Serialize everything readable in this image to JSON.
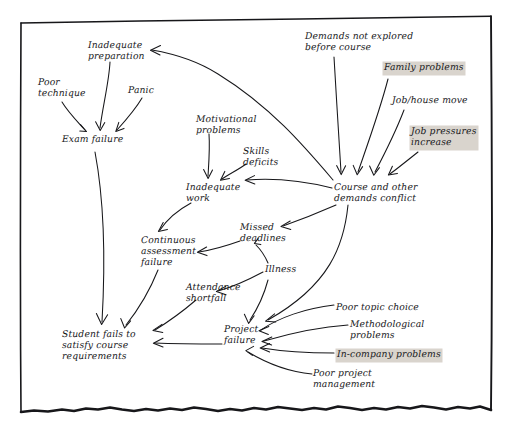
{
  "diagram": {
    "medium": "hand-drawn-sketch",
    "ink_color": "#17171a",
    "paper_color": "#ffffff",
    "highlight_color": "#d9d4cd",
    "frame": {
      "style": "hand-drawn rectangle, torn wavy bottom edge",
      "left_x": 20,
      "right_x": 492,
      "top_y_left": 22,
      "top_y_right": 16,
      "bottom_y": 414
    },
    "nodes": [
      {
        "id": "inadequate-preparation",
        "label": "Inadequate\npreparation",
        "x": 88,
        "y": 41,
        "highlight": false
      },
      {
        "id": "poor-technique",
        "label": "Poor\ntechnique",
        "x": 38,
        "y": 78,
        "highlight": false
      },
      {
        "id": "panic",
        "label": "Panic",
        "x": 128,
        "y": 86,
        "highlight": false
      },
      {
        "id": "exam-failure",
        "label": "Exam failure",
        "x": 62,
        "y": 135,
        "highlight": false
      },
      {
        "id": "motivational-problems",
        "label": "Motivational\nproblems",
        "x": 196,
        "y": 115,
        "highlight": false
      },
      {
        "id": "skills-deficits",
        "label": "Skills\ndeficits",
        "x": 243,
        "y": 147,
        "highlight": false
      },
      {
        "id": "inadequate-work",
        "label": "Inadequate\nwork",
        "x": 186,
        "y": 183,
        "highlight": false
      },
      {
        "id": "demands-not-explored",
        "label": "Demands not explored\nbefore course",
        "x": 305,
        "y": 32,
        "highlight": false
      },
      {
        "id": "family-problems",
        "label": "Family problems",
        "x": 384,
        "y": 63,
        "highlight": true
      },
      {
        "id": "job-house-move",
        "label": "Job/house move",
        "x": 392,
        "y": 96,
        "highlight": false
      },
      {
        "id": "job-pressures-increase",
        "label": "Job pressures\nincrease",
        "x": 411,
        "y": 127,
        "highlight": true
      },
      {
        "id": "course-demands-conflict",
        "label": "Course and other\ndemands conflict",
        "x": 334,
        "y": 183,
        "highlight": false
      },
      {
        "id": "missed-deadlines",
        "label": "Missed\ndeadlines",
        "x": 240,
        "y": 223,
        "highlight": false
      },
      {
        "id": "continuous-assessment-failure",
        "label": "Continuous\nassessment\nfailure",
        "x": 141,
        "y": 236,
        "highlight": false
      },
      {
        "id": "illness",
        "label": "Illness",
        "x": 265,
        "y": 265,
        "highlight": false
      },
      {
        "id": "attendance-shortfall",
        "label": "Attendance\nshortfall",
        "x": 186,
        "y": 283,
        "highlight": false
      },
      {
        "id": "student-fails",
        "label": "Student fails to\nsatisfy course\nrequirements",
        "x": 62,
        "y": 330,
        "highlight": false
      },
      {
        "id": "project-failure",
        "label": "Project\nfailure",
        "x": 224,
        "y": 325,
        "highlight": false
      },
      {
        "id": "poor-topic-choice",
        "label": "Poor topic choice",
        "x": 336,
        "y": 303,
        "highlight": false
      },
      {
        "id": "methodological-problems",
        "label": "Methodological\nproblems",
        "x": 350,
        "y": 320,
        "highlight": false
      },
      {
        "id": "in-company-problems",
        "label": "In-company problems",
        "x": 337,
        "y": 350,
        "highlight": true
      },
      {
        "id": "poor-project-management",
        "label": "Poor project\nmanagement",
        "x": 313,
        "y": 369,
        "highlight": false
      }
    ],
    "edges": [
      {
        "from": "poor-technique",
        "to": "exam-failure"
      },
      {
        "from": "inadequate-preparation",
        "to": "exam-failure"
      },
      {
        "from": "panic",
        "to": "exam-failure"
      },
      {
        "from": "exam-failure",
        "to": "student-fails"
      },
      {
        "from": "motivational-problems",
        "to": "inadequate-work"
      },
      {
        "from": "skills-deficits",
        "to": "inadequate-work"
      },
      {
        "from": "course-demands-conflict",
        "to": "inadequate-preparation"
      },
      {
        "from": "course-demands-conflict",
        "to": "inadequate-work"
      },
      {
        "from": "demands-not-explored",
        "to": "course-demands-conflict"
      },
      {
        "from": "family-problems",
        "to": "course-demands-conflict"
      },
      {
        "from": "job-house-move",
        "to": "course-demands-conflict"
      },
      {
        "from": "job-pressures-increase",
        "to": "course-demands-conflict"
      },
      {
        "from": "course-demands-conflict",
        "to": "missed-deadlines"
      },
      {
        "from": "course-demands-conflict",
        "to": "project-failure"
      },
      {
        "from": "inadequate-work",
        "to": "continuous-assessment-failure"
      },
      {
        "from": "missed-deadlines",
        "to": "continuous-assessment-failure"
      },
      {
        "from": "illness",
        "to": "missed-deadlines"
      },
      {
        "from": "illness",
        "to": "attendance-shortfall"
      },
      {
        "from": "illness",
        "to": "project-failure"
      },
      {
        "from": "continuous-assessment-failure",
        "to": "student-fails"
      },
      {
        "from": "attendance-shortfall",
        "to": "student-fails"
      },
      {
        "from": "project-failure",
        "to": "student-fails"
      },
      {
        "from": "poor-topic-choice",
        "to": "project-failure"
      },
      {
        "from": "methodological-problems",
        "to": "project-failure"
      },
      {
        "from": "in-company-problems",
        "to": "project-failure"
      },
      {
        "from": "poor-project-management",
        "to": "project-failure"
      }
    ]
  }
}
